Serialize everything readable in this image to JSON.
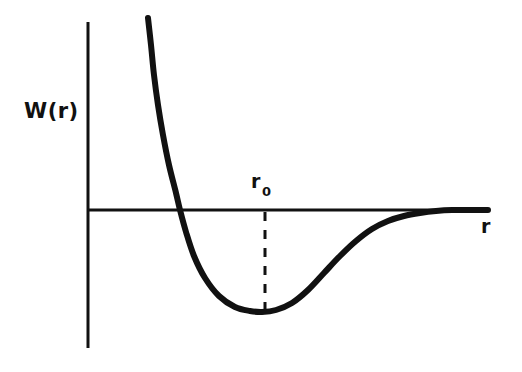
{
  "figure": {
    "type": "potential-energy-curve",
    "background_color": "#ffffff",
    "ink_color": "#111111",
    "width": 522,
    "height": 372
  },
  "labels": {
    "y_axis": "W(r)",
    "x_axis": "r",
    "equilibrium_symbol": "r",
    "equilibrium_subscript": "0"
  },
  "chart_data": {
    "type": "line",
    "title": "",
    "subtitle": "",
    "xlabel": "r",
    "ylabel": "W(r)",
    "grid": false,
    "legend": null,
    "annotations": [
      {
        "name": "equilibrium-separation",
        "text": "r0",
        "description": "Dashed vertical guide line dropped from the r axis to the minimum of the potential well",
        "x_pixel": 265,
        "y_top_pixel": 212,
        "y_bottom_pixel": 312
      }
    ],
    "axes": {
      "y_axis_x_pixel": 88,
      "y_axis_top_pixel": 22,
      "y_axis_bottom_pixel": 348,
      "x_axis_y_pixel": 210,
      "x_axis_left_pixel": 88,
      "x_axis_right_pixel": 488,
      "zero_line": "x-axis marks W(r) = 0"
    },
    "series": [
      {
        "name": "W(r)",
        "description": "Interatomic pair potential: steep short-range repulsion, minimum at r0, long-range attractive tail approaching zero",
        "points_pixel": [
          [
            148,
            18
          ],
          [
            151,
            45
          ],
          [
            154,
            75
          ],
          [
            158,
            105
          ],
          [
            163,
            135
          ],
          [
            169,
            165
          ],
          [
            176,
            193
          ],
          [
            180,
            210
          ],
          [
            186,
            232
          ],
          [
            194,
            256
          ],
          [
            205,
            278
          ],
          [
            219,
            296
          ],
          [
            235,
            307
          ],
          [
            250,
            311
          ],
          [
            262,
            312
          ],
          [
            276,
            310
          ],
          [
            292,
            303
          ],
          [
            308,
            290
          ],
          [
            324,
            273
          ],
          [
            340,
            256
          ],
          [
            356,
            241
          ],
          [
            372,
            229
          ],
          [
            388,
            221
          ],
          [
            404,
            216
          ],
          [
            420,
            213
          ],
          [
            436,
            211
          ],
          [
            452,
            210
          ],
          [
            470,
            210
          ],
          [
            488,
            210
          ]
        ]
      }
    ]
  }
}
